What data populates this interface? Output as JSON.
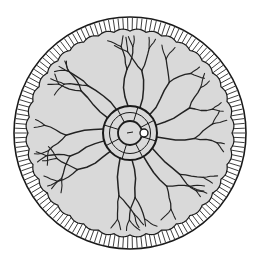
{
  "diagram": {
    "type": "radial-cross-section",
    "canvas": {
      "width": 260,
      "height": 267,
      "background": "#ffffff"
    },
    "center": {
      "x": 130,
      "y": 133
    },
    "colors": {
      "outline": "#1a1a1a",
      "rim_fill": "#ffffff",
      "hatch": "#2a2a2a",
      "interior_fill": "#d9d9d9",
      "canal": "#222222"
    },
    "rim": {
      "outer_radius": 116,
      "inner_radius": 104,
      "hatch_count": 150,
      "scallops": 40
    },
    "central_rings": {
      "outer_radius": 27,
      "inner_radius": 12,
      "small_circle": {
        "dx": 14,
        "dy": 0,
        "r": 4
      }
    },
    "labels": []
  }
}
